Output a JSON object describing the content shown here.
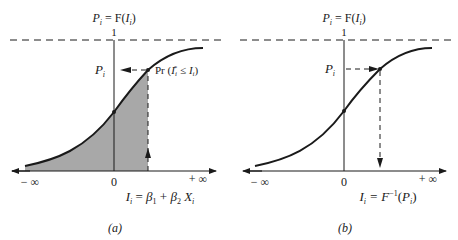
{
  "figure": {
    "panels": [
      {
        "id": "a",
        "caption": "(a)",
        "y_axis_label": "P_i = F(I_i)",
        "y_axis_label_parts": {
          "lhs": "P",
          "lhs_sub": "i",
          "eq": " = F(",
          "arg": "I",
          "arg_sub": "i",
          "close": ")"
        },
        "asymptote_label": "1",
        "point_label": "P_i",
        "point_label_parts": {
          "main": "P",
          "sub": "i"
        },
        "annotation": "Pr (I_i* ≤ I_i)",
        "annotation_parts": {
          "pre": "Pr (",
          "var": "I",
          "sub": "i",
          "sup": "*",
          "mid": " ≤ ",
          "var2": "I",
          "sub2": "i",
          "post": ")"
        },
        "x_left": "− ∞",
        "x_origin": "0",
        "x_right": "+ ∞",
        "x_formula": "I_i = β1 + β2 Xi",
        "x_formula_parts": {
          "lhs": "I",
          "lhs_sub": "i",
          "eq": " = ",
          "b1": "β",
          "b1_sub": "1",
          "plus": " + ",
          "b2": "β",
          "b2_sub": "2",
          "x": " X",
          "x_sub": "i"
        },
        "shaded": true,
        "arrow_direction": "up-then-left"
      },
      {
        "id": "b",
        "caption": "(b)",
        "y_axis_label": "P_i = F(I_i)",
        "y_axis_label_parts": {
          "lhs": "P",
          "lhs_sub": "i",
          "eq": " = F(",
          "arg": "I",
          "arg_sub": "i",
          "close": ")"
        },
        "asymptote_label": "1",
        "point_label": "P_i",
        "point_label_parts": {
          "main": "P",
          "sub": "i"
        },
        "x_left": "− ∞",
        "x_origin": "0",
        "x_right": "+ ∞",
        "x_formula": "I_i = F^-1(P_i)",
        "x_formula_parts": {
          "lhs": "I",
          "lhs_sub": "i",
          "eq": " = F",
          "sup": "−1",
          "open": "(",
          "arg": "P",
          "arg_sub": "i",
          "close": ")"
        },
        "shaded": false,
        "arrow_direction": "right-then-down"
      }
    ],
    "colors": {
      "ink": "#1a1a1a",
      "shade": "#a8a8a8"
    }
  }
}
